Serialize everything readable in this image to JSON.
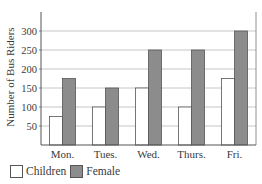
{
  "chart_data": {
    "type": "bar",
    "title": "",
    "xlabel": "",
    "ylabel": "Number of Bus Riders",
    "categories": [
      "Mon.",
      "Tues.",
      "Wed.",
      "Thurs.",
      "Fri."
    ],
    "series": [
      {
        "name": "Children",
        "values": [
          75,
          100,
          150,
          100,
          175
        ],
        "color": "#ffffff"
      },
      {
        "name": "Female",
        "values": [
          175,
          150,
          250,
          250,
          300
        ],
        "color": "#8c8c8c"
      }
    ],
    "yticks": [
      50,
      100,
      150,
      200,
      250,
      300
    ],
    "ylim": [
      0,
      350
    ],
    "grid": true,
    "legend_position": "bottom-left"
  },
  "legend": {
    "children_label": "Children",
    "female_label": "Female"
  }
}
